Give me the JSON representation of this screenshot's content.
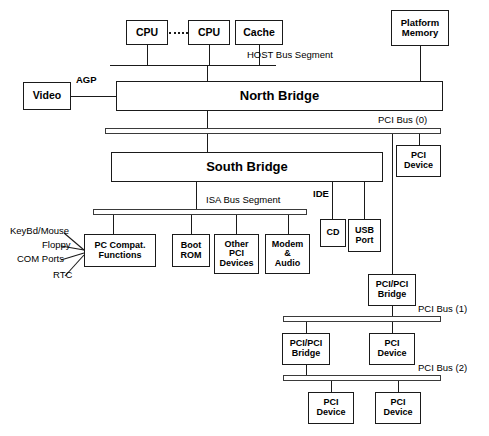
{
  "diagram": {
    "nodes": {
      "cpu1": "CPU",
      "cpu2": "CPU",
      "cache": "Cache",
      "platform_memory": "Platform\nMemory",
      "video": "Video",
      "north_bridge": "North Bridge",
      "south_bridge": "South Bridge",
      "pci_device_0": "PCI\nDevice",
      "pc_compat": "PC Compat.\nFunctions",
      "boot_rom": "Boot\nROM",
      "other_pci": "Other\nPCI\nDevices",
      "modem_audio": "Modem\n&\nAudio",
      "cd": "CD",
      "usb_port": "USB\nPort",
      "pci_pci_bridge_1": "PCI/PCI\nBridge",
      "pci_pci_bridge_2": "PCI/PCI\nBridge",
      "pci_device_1": "PCI\nDevice",
      "pci_device_2a": "PCI\nDevice",
      "pci_device_2b": "PCI\nDevice"
    },
    "node_lines": {
      "platform_memory": [
        "Platform",
        "Memory"
      ],
      "pci_device_0": [
        "PCI",
        "Device"
      ],
      "pc_compat": [
        "PC Compat.",
        "Functions"
      ],
      "boot_rom": [
        "Boot",
        "ROM"
      ],
      "other_pci": [
        "Other",
        "PCI",
        "Devices"
      ],
      "modem_audio": [
        "Modem",
        "&",
        "Audio"
      ],
      "usb_port": [
        "USB",
        "Port"
      ],
      "pci_pci_bridge_1": [
        "PCI/PCI",
        "Bridge"
      ],
      "pci_pci_bridge_2": [
        "PCI/PCI",
        "Bridge"
      ],
      "pci_device_1": [
        "PCI",
        "Device"
      ],
      "pci_device_2a": [
        "PCI",
        "Device"
      ],
      "pci_device_2b": [
        "PCI",
        "Device"
      ]
    },
    "bus_labels": {
      "host": "HOST Bus Segment",
      "pci0": "PCI Bus (0)",
      "isa": "ISA Bus Segment",
      "pci1": "PCI Bus (1)",
      "pci2": "PCI Bus (2)"
    },
    "link_labels": {
      "agp": "AGP",
      "ide": "IDE"
    },
    "io_labels": [
      "KeyBd/Mouse",
      "Floppy",
      "COM Ports",
      "RTC"
    ],
    "colors": {
      "line": "#1a1a1a",
      "bus_stroke": "#3a3a3a",
      "background": "#ffffff",
      "text": "#000000"
    }
  }
}
